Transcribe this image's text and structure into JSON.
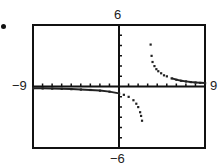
{
  "chart_data": {
    "type": "scatter",
    "title": "",
    "window": {
      "xmin": -9,
      "xmax": 9,
      "ymin": -6,
      "ymax": 6,
      "xscl": 1,
      "yscl": 1
    },
    "xlabel": "",
    "ylabel": "",
    "axis_labels": {
      "top": "6",
      "bottom": "-6",
      "left": "-9",
      "right": "9"
    },
    "grid": false,
    "series": [
      {
        "name": "left-branch",
        "points": [
          [
            -9,
            -0.17
          ],
          [
            -8,
            -0.18
          ],
          [
            -7,
            -0.2
          ],
          [
            -6,
            -0.22
          ],
          [
            -5,
            -0.25
          ],
          [
            -4,
            -0.29
          ],
          [
            -3,
            -0.33
          ],
          [
            -2,
            -0.4
          ],
          [
            -1,
            -0.5
          ],
          [
            0,
            -0.67
          ],
          [
            0.5,
            -0.8
          ],
          [
            1,
            -1.0
          ],
          [
            1.5,
            -1.33
          ],
          [
            1.8,
            -1.67
          ],
          [
            2,
            -2.0
          ],
          [
            2.2,
            -2.5
          ],
          [
            2.3,
            -2.86
          ],
          [
            2.4,
            -3.33
          ]
        ]
      },
      {
        "name": "right-branch",
        "points": [
          [
            3.3,
            4.1
          ],
          [
            3.4,
            3.0
          ],
          [
            3.5,
            2.4
          ],
          [
            3.7,
            2.0
          ],
          [
            3.9,
            1.7
          ],
          [
            4.1,
            1.5
          ],
          [
            4.4,
            1.3
          ],
          [
            4.7,
            1.1
          ],
          [
            5,
            1.0
          ],
          [
            5.5,
            0.8
          ],
          [
            6,
            0.67
          ],
          [
            6.5,
            0.57
          ],
          [
            7,
            0.5
          ],
          [
            7.5,
            0.44
          ],
          [
            8,
            0.4
          ],
          [
            8.5,
            0.36
          ],
          [
            9,
            0.33
          ]
        ]
      }
    ]
  },
  "marker": "bullet"
}
